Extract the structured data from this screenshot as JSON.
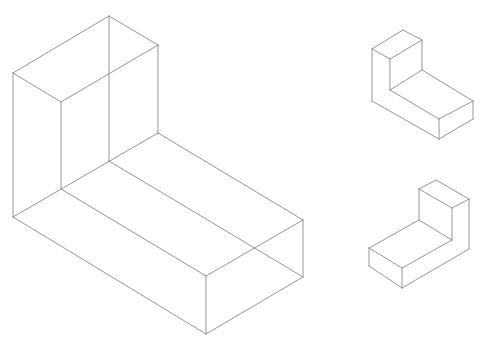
{
  "diagram": {
    "type": "isometric-wireframe",
    "stroke_color": "#8a8a8a",
    "stroke_width": 0.9,
    "figures": [
      {
        "name": "large-l-block-transparent",
        "edges": [
          [
            109,
            16,
            158,
            45
          ],
          [
            109,
            16,
            13,
            73
          ],
          [
            13,
            73,
            61,
            102
          ],
          [
            61,
            102,
            158,
            45
          ],
          [
            109,
            16,
            109,
            161
          ],
          [
            158,
            45,
            158,
            133
          ],
          [
            13,
            73,
            13,
            217
          ],
          [
            61,
            102,
            61,
            189
          ],
          [
            158,
            133,
            303,
            220
          ],
          [
            109,
            161,
            303,
            277
          ],
          [
            61,
            189,
            206,
            276
          ],
          [
            13,
            217,
            206,
            334
          ],
          [
            158,
            133,
            13,
            217
          ],
          [
            303,
            220,
            206,
            276
          ],
          [
            303,
            277,
            206,
            334
          ],
          [
            303,
            220,
            303,
            277
          ],
          [
            206,
            276,
            206,
            334
          ]
        ]
      },
      {
        "name": "small-l-block-top",
        "edges": [
          [
            403,
            30,
            422,
            40
          ],
          [
            403,
            30,
            372,
            49
          ],
          [
            372,
            49,
            390,
            59
          ],
          [
            390,
            59,
            422,
            40
          ],
          [
            422,
            40,
            422,
            70
          ],
          [
            390,
            59,
            390,
            90
          ],
          [
            372,
            49,
            372,
            101
          ],
          [
            422,
            70,
            473,
            101
          ],
          [
            390,
            90,
            439,
            119
          ],
          [
            422,
            70,
            390,
            90
          ],
          [
            473,
            101,
            439,
            119
          ],
          [
            473,
            101,
            473,
            119
          ],
          [
            439,
            119,
            439,
            139
          ],
          [
            473,
            119,
            439,
            139
          ],
          [
            372,
            101,
            439,
            139
          ]
        ]
      },
      {
        "name": "small-l-block-bottom",
        "edges": [
          [
            436,
            180,
            469,
            199
          ],
          [
            436,
            180,
            419,
            189
          ],
          [
            419,
            189,
            452,
            208
          ],
          [
            452,
            208,
            469,
            199
          ],
          [
            419,
            189,
            419,
            220
          ],
          [
            452,
            208,
            452,
            240
          ],
          [
            469,
            199,
            469,
            249
          ],
          [
            419,
            220,
            369,
            248
          ],
          [
            452,
            240,
            402,
            268
          ],
          [
            419,
            220,
            452,
            240
          ],
          [
            369,
            248,
            402,
            268
          ],
          [
            369,
            248,
            369,
            266
          ],
          [
            402,
            268,
            402,
            288
          ],
          [
            369,
            266,
            402,
            288
          ],
          [
            469,
            249,
            402,
            288
          ]
        ]
      }
    ]
  }
}
